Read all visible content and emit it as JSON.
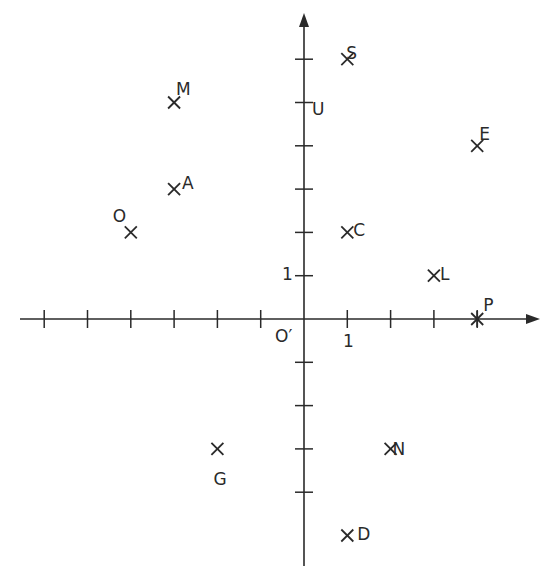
{
  "diagram": {
    "type": "coordinate-grid",
    "origin_label": "O′",
    "x_unit_label": "1",
    "y_unit_label": "1",
    "ink_color": "#2a2a2a",
    "background": "#ffffff"
  },
  "chart_data": {
    "type": "scatter",
    "title": "",
    "xlabel": "",
    "ylabel": "",
    "xlim": [
      -6,
      5
    ],
    "ylim": [
      -6,
      6
    ],
    "grid": false,
    "origin": "O′",
    "x_ticks": [
      -6,
      -5,
      -4,
      -3,
      -2,
      -1,
      1,
      2,
      3,
      4
    ],
    "y_ticks": [
      -4,
      -3,
      -2,
      -1,
      1,
      2,
      3,
      4,
      5,
      6
    ],
    "points": [
      {
        "label": "S",
        "x": 1,
        "y": 6,
        "marker": "x"
      },
      {
        "label": "U",
        "x": 0,
        "y": 5,
        "marker": "tick"
      },
      {
        "label": "M",
        "x": -3,
        "y": 5,
        "marker": "x"
      },
      {
        "label": "E",
        "x": 4,
        "y": 4,
        "marker": "x"
      },
      {
        "label": "A",
        "x": -3,
        "y": 3,
        "marker": "x"
      },
      {
        "label": "O",
        "x": -4,
        "y": 2,
        "marker": "x"
      },
      {
        "label": "C",
        "x": 1,
        "y": 2,
        "marker": "x"
      },
      {
        "label": "L",
        "x": 3,
        "y": 1,
        "marker": "x"
      },
      {
        "label": "P",
        "x": 4,
        "y": 0,
        "marker": "asterisk"
      },
      {
        "label": "G",
        "x": -2,
        "y": -3,
        "marker": "x"
      },
      {
        "label": "N",
        "x": 2,
        "y": -3,
        "marker": "x"
      },
      {
        "label": "D",
        "x": 1,
        "y": -5,
        "marker": "x"
      }
    ]
  }
}
